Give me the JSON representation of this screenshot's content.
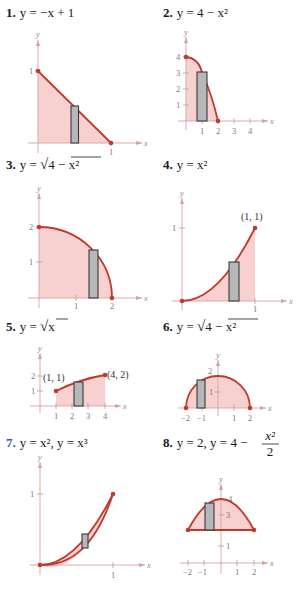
{
  "problems": [
    {
      "number": "1.",
      "equation": "y = −x + 1",
      "x_label": "x",
      "y_label": "y",
      "x_ticks": [
        "1"
      ],
      "y_ticks": [
        "1"
      ]
    },
    {
      "number": "2.",
      "equation": "y = 4 − x²",
      "x_label": "x",
      "y_label": "y",
      "x_ticks": [
        "1",
        "2",
        "3",
        "4"
      ],
      "y_ticks": [
        "1",
        "2",
        "3",
        "4"
      ]
    },
    {
      "number": "3.",
      "equation": "y = √(4 − x²)",
      "eq_prefix": "y = ",
      "eq_radicand": "4 − x²",
      "x_label": "x",
      "y_label": "y",
      "x_ticks": [
        "1",
        "2"
      ],
      "y_ticks": [
        "1",
        "2"
      ]
    },
    {
      "number": "4.",
      "equation": "y = x²",
      "x_label": "x",
      "y_label": "y",
      "x_ticks": [
        "1"
      ],
      "y_ticks": [
        "1"
      ],
      "point_label": "(1, 1)"
    },
    {
      "number": "5.",
      "equation": "y = √x",
      "eq_prefix": "y = ",
      "eq_radicand": "x",
      "x_label": "x",
      "y_label": "y",
      "x_ticks": [
        "1",
        "2",
        "3",
        "4"
      ],
      "y_ticks": [
        "1",
        "2"
      ],
      "point_labels": [
        "(1, 1)",
        "(4, 2)"
      ]
    },
    {
      "number": "6.",
      "equation": "y = √(4 − x²)",
      "eq_prefix": "y = ",
      "eq_radicand": "4 − x²",
      "x_label": "x",
      "y_label": "y",
      "x_ticks": [
        "−2",
        "−1",
        "1",
        "2"
      ],
      "y_ticks": [
        "1",
        "2"
      ]
    },
    {
      "number": "7.",
      "equation": "y = x², y = x³",
      "x_label": "x",
      "y_label": "y",
      "x_ticks": [
        "1"
      ],
      "y_ticks": [
        "1"
      ]
    },
    {
      "number": "8.",
      "equation": "y = 2, y = 4 − x²/2",
      "eq_prefix": "y = 2, y = 4 − ",
      "frac_num": "x²",
      "frac_den": "2",
      "x_label": "x",
      "y_label": "y",
      "x_ticks": [
        "−2",
        "−1",
        "1",
        "2"
      ],
      "y_ticks": [
        "1",
        "3",
        "4"
      ]
    }
  ],
  "colors": {
    "curve": "#c0392b",
    "region": "#f6c9c8",
    "rectangle": "#b5b7ba",
    "number_blue": "#2f5fa7"
  }
}
